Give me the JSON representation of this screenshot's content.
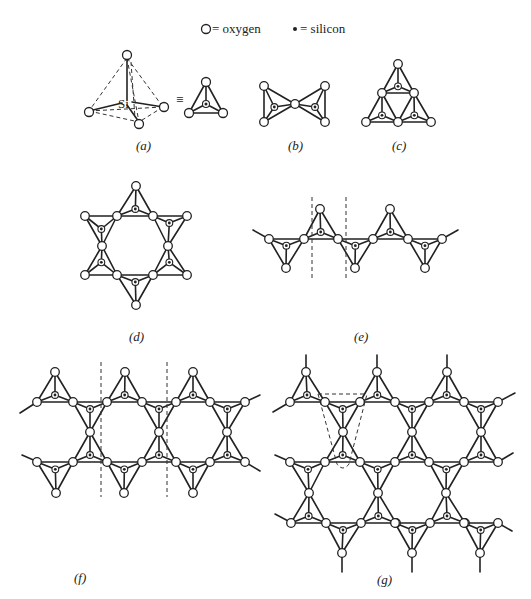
{
  "legend": {
    "oxygen_label": "= oxygen",
    "silicon_label": "= silicon"
  },
  "panel_a": {
    "label": "(a)",
    "si_label": "Si",
    "equiv": "≡"
  },
  "panel_b": {
    "label": "(b)"
  },
  "panel_c": {
    "label": "(c)"
  },
  "panel_d": {
    "label": "(d)"
  },
  "panel_e": {
    "label": "(e)"
  },
  "panel_f": {
    "label": "(f)"
  },
  "panel_g": {
    "label": "(g)"
  },
  "colors": {
    "ink": "#222222",
    "background": "#ffffff"
  }
}
